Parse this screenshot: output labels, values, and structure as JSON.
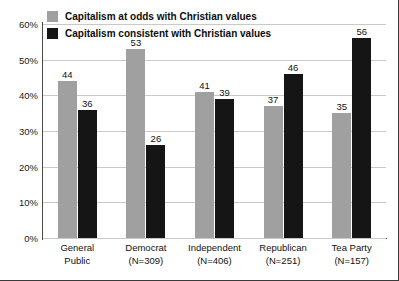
{
  "chart_data": {
    "type": "bar",
    "title": "",
    "xlabel": "",
    "ylabel": "",
    "ylim": [
      0,
      60
    ],
    "grid": true,
    "legend_position": "top-left",
    "ytick_labels": [
      "0%",
      "10%",
      "20%",
      "30%",
      "40%",
      "50%",
      "60%"
    ],
    "ytick_values": [
      0,
      10,
      20,
      30,
      40,
      50,
      60
    ],
    "categories": [
      "General\nPublic",
      "Democrat\n(N=309)",
      "Independent\n(N=406)",
      "Republican\n(N=251)",
      "Tea Party\n(N=157)"
    ],
    "category_lines": [
      [
        "General",
        "Public"
      ],
      [
        "Democrat",
        "(N=309)"
      ],
      [
        "Independent",
        "(N=406)"
      ],
      [
        "Republican",
        "(N=251)"
      ],
      [
        "Tea Party",
        "(N=157)"
      ]
    ],
    "series": [
      {
        "name": "Capitalism at odds with Christian values",
        "color": "#a0a0a0",
        "values": [
          44,
          53,
          41,
          37,
          35
        ]
      },
      {
        "name": "Capitalism consistent with Christian values",
        "color": "#151515",
        "values": [
          36,
          26,
          39,
          46,
          56
        ]
      }
    ]
  },
  "legend": {
    "items": [
      {
        "label": "Capitalism at odds with Christian values",
        "color": "#a0a0a0"
      },
      {
        "label": "Capitalism consistent with Christian values",
        "color": "#151515"
      }
    ]
  }
}
